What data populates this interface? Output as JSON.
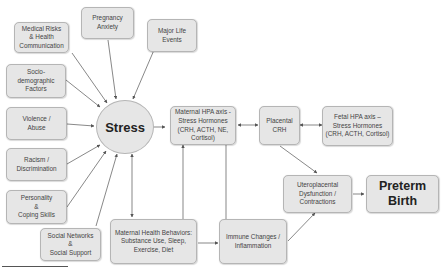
{
  "diagram": {
    "center": {
      "label": "Stress"
    },
    "factors": [
      {
        "id": "medical",
        "label": "Medical Risks\n& Health\nCommunication"
      },
      {
        "id": "pregnancy",
        "label": "Pregnancy\nAnxiety"
      },
      {
        "id": "lifeevents",
        "label": "Major Life\nEvents"
      },
      {
        "id": "socio",
        "label": "Socio-\ndemographic\nFactors"
      },
      {
        "id": "violence",
        "label": "Violence /\nAbuse"
      },
      {
        "id": "racism",
        "label": "Racism /\nDiscrimination"
      },
      {
        "id": "personality",
        "label": "Personality\n&\nCoping Skills"
      },
      {
        "id": "social",
        "label": "Social Networks\n&\nSocial Support"
      }
    ],
    "nodes": {
      "maternal_hpa": "Maternal HPA axis -\nStress Hormones\n(CRH, ACTH, NE,\nCortisol)",
      "placental_crh": "Placental\nCRH",
      "fetal_hpa": "Fetal HPA axis –\nStress Hormones\n(CRH, ACTH, Cortisol)",
      "uteroplacental": "Uteroplacental\nDysfunction /\nContractions",
      "preterm": "Preterm\nBirth",
      "health_behaviors": "Maternal Health Behaviors:\nSubstance Use, Sleep,\nExercise, Diet",
      "immune": "Immune Changes /\nInflammation"
    },
    "colors": {
      "box_fill": "#e6e6e6",
      "box_border": "#b5b5b5",
      "arrow": "#555555"
    }
  }
}
